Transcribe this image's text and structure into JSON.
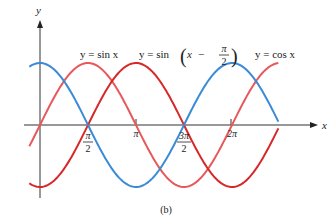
{
  "chart_data": {
    "type": "line",
    "title": "",
    "caption": "(b)",
    "xlabel": "x",
    "ylabel": "y",
    "x_ticks": [
      {
        "value": 1.5708,
        "label": "π/2"
      },
      {
        "value": 3.1416,
        "label": "π"
      },
      {
        "value": 4.7124,
        "label": "3π/2"
      },
      {
        "value": 6.2832,
        "label": "2π"
      }
    ],
    "xlim": [
      -0.35,
      7.8
    ],
    "ylim": [
      -1.15,
      1.15
    ],
    "grid": false,
    "legend_position": "inline labels above curves",
    "series": [
      {
        "name": "y = sin x",
        "function": "sin(x)",
        "color": "#e8585a",
        "x_range": [
          -0.35,
          7.8
        ]
      },
      {
        "name": "y = sin(x − π/2)",
        "function": "sin(x - pi/2)",
        "color": "#d62828",
        "x_range": [
          -0.35,
          7.8
        ]
      },
      {
        "name": "y = cos x",
        "function": "cos(x)",
        "color": "#3a8ad6",
        "x_range": [
          -0.35,
          7.8
        ]
      }
    ]
  },
  "labels": {
    "sin": "y = sin x",
    "shift_prefix": "y = sin",
    "shift_x": "x",
    "shift_minus": "−",
    "pi": "π",
    "two": "2",
    "cos": "y = cos x",
    "xaxis": "x",
    "yaxis": "y",
    "tick_pi_2_num": "π",
    "tick_pi_2_den": "2",
    "tick_pi": "π",
    "tick_3pi_2_num": "3π",
    "tick_3pi_2_den": "2",
    "tick_2pi": "2π",
    "caption": "(b)"
  }
}
